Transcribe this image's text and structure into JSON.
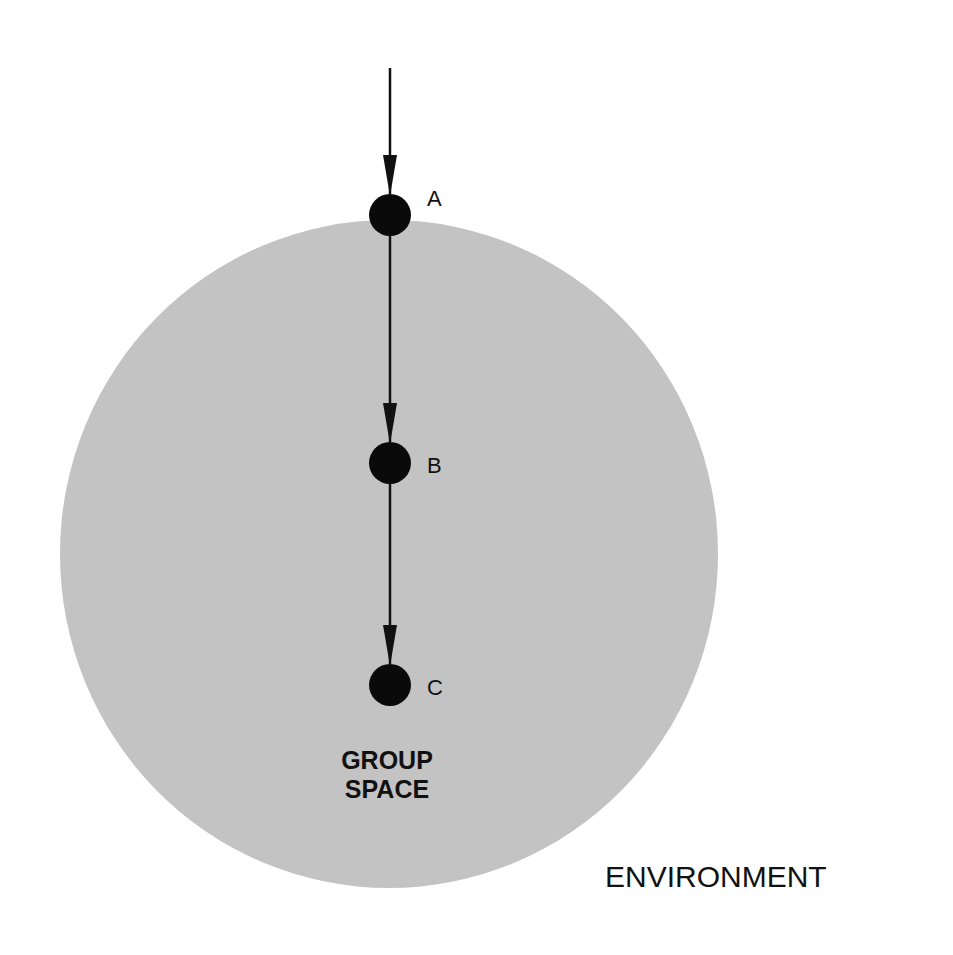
{
  "diagram": {
    "type": "flow-into-circle",
    "colors": {
      "background": "#ffffff",
      "group_space_fill": "#c3c3c3",
      "node_fill": "#0a0a0a",
      "line": "#111111"
    },
    "nodes": [
      {
        "id": "A",
        "label": "A"
      },
      {
        "id": "B",
        "label": "B"
      },
      {
        "id": "C",
        "label": "C"
      }
    ],
    "edges": [
      {
        "from": "outside",
        "to": "A",
        "arrow": true
      },
      {
        "from": "A",
        "to": "B",
        "arrow": true
      },
      {
        "from": "B",
        "to": "C",
        "arrow": true
      }
    ],
    "group_space": {
      "line1": "GROUP",
      "line2": "SPACE"
    },
    "environment_label": "ENVIRONMENT"
  }
}
